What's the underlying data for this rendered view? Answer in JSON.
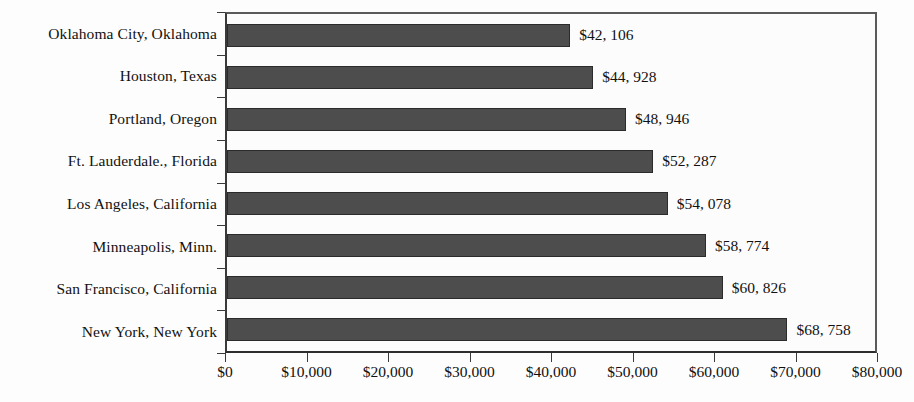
{
  "chart_data": {
    "type": "bar",
    "orientation": "horizontal",
    "title": "",
    "subtitle": "",
    "xlabel": "",
    "ylabel": "",
    "xlim": [
      0,
      80000
    ],
    "grid": false,
    "legend": null,
    "categories": [
      "Oklahoma City, Oklahoma",
      "Houston, Texas",
      "Portland, Oregon",
      "Ft. Lauderdale., Florida",
      "Los Angeles, California",
      "Minneapolis, Minn.",
      "San Francisco, California",
      "New York, New York"
    ],
    "values": [
      42106,
      44928,
      48946,
      52287,
      54078,
      58774,
      60826,
      68758
    ],
    "value_labels": [
      "$42, 106",
      "$44, 928",
      "$48, 946",
      "$52, 287",
      "$54, 078",
      "$58, 774",
      "$60, 826",
      "$68, 758"
    ],
    "xticks": [
      0,
      10000,
      20000,
      30000,
      40000,
      50000,
      60000,
      70000,
      80000
    ],
    "xtick_labels": [
      "$0",
      "$10,000",
      "$20,000",
      "$30,000",
      "$40,000",
      "$50,000",
      "$60,000",
      "$70,000",
      "$80,000"
    ],
    "colors": {
      "bar_fill": "#4d4d4d",
      "bar_border": "#2b2b2b",
      "plot_background": "#fcfcfc",
      "axis": "#3a3a3a",
      "text": "#111111",
      "page_background": "#fdfdfd"
    }
  }
}
